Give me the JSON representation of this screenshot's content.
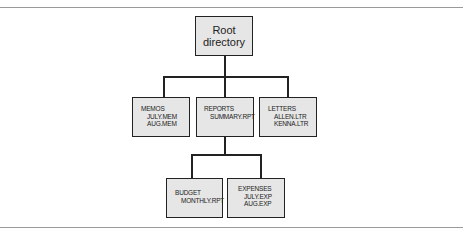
{
  "diagram": {
    "type": "directory-tree",
    "root": {
      "label_line1": "Root",
      "label_line2": "directory"
    },
    "level1": [
      {
        "name": "MEMOS",
        "files": [
          "JULY.MEM",
          "AUG.MEM"
        ]
      },
      {
        "name": "REPORTS",
        "files": [
          "SUMMARY.RPT"
        ]
      },
      {
        "name": "LETTERS",
        "files": [
          "ALLEN.LTR",
          "KENNA.LTR"
        ]
      }
    ],
    "level2": [
      {
        "name": "BUDGET",
        "files": [
          "MONTHLY.RPT"
        ],
        "parent": "REPORTS"
      },
      {
        "name": "EXPENSES",
        "files": [
          "JULY.EXP",
          "AUG.EXP"
        ],
        "parent": "REPORTS"
      }
    ]
  }
}
